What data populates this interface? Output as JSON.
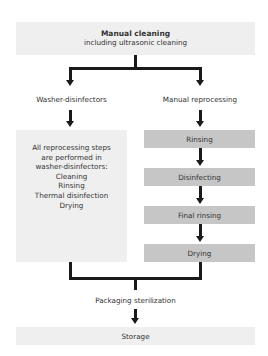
{
  "diagram": {
    "top": {
      "title": "Manual cleaning",
      "subtitle": "including ultrasonic cleaning"
    },
    "branches": {
      "left_label": "Washer-disinfectors",
      "right_label": "Manual reprocessing"
    },
    "left_box": {
      "lines": [
        "All reprocessing steps",
        "are performed in",
        "washer-disinfectors:",
        "Cleaning",
        "Rinsing",
        "Thermal disinfection",
        "Drying"
      ]
    },
    "right_steps": [
      "Rinsing",
      "Disinfecting",
      "Final rinsing",
      "Drying"
    ],
    "merge_label": "Packaging sterilization",
    "final": "Storage"
  },
  "colors": {
    "light_box": "#efefef",
    "dark_box": "#c6c6c6",
    "line": "#1a1a1a"
  }
}
